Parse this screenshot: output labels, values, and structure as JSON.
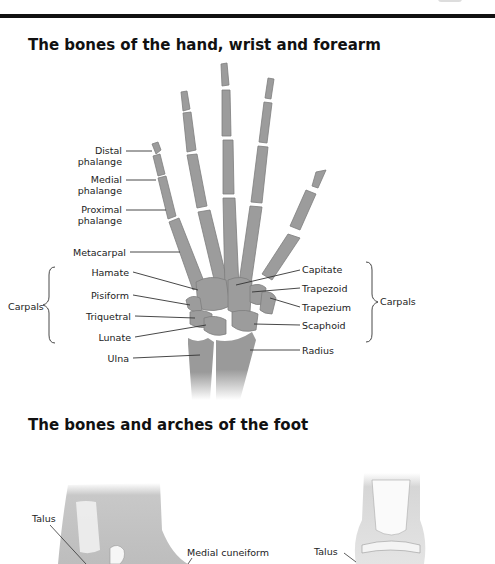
{
  "page": {
    "header_rule": true
  },
  "hand_section": {
    "title": "The bones of the hand, wrist and forearm",
    "labels_left": {
      "distal_1": "Distal",
      "distal_2": "phalange",
      "medial_1": "Medial",
      "medial_2": "phalange",
      "proximal_1": "Proximal",
      "proximal_2": "phalange",
      "metacarpal": "Metacarpal",
      "hamate": "Hamate",
      "pisiform": "Pisiform",
      "triquetral": "Triquetral",
      "lunate": "Lunate",
      "ulna": "Ulna"
    },
    "labels_right": {
      "capitate": "Capitate",
      "trapezoid": "Trapezoid",
      "trapezium": "Trapezium",
      "scaphoid": "Scaphoid",
      "radius": "Radius"
    },
    "group_left": "Carpals",
    "group_right": "Carpals",
    "bone_color": "#9a9a9a"
  },
  "foot_section": {
    "title": "The bones and arches of the foot",
    "labels": {
      "talus_left": "Talus",
      "medial_cuneiform": "Medial cuneiform",
      "talus_right": "Talus"
    }
  }
}
